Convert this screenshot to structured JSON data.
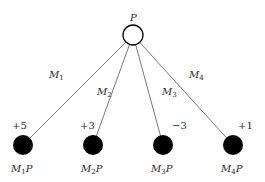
{
  "diagram": {
    "root": {
      "label": "P",
      "x": 133,
      "y": 35,
      "r": 10,
      "fill": "#ffffff",
      "stroke": "#000000"
    },
    "edges": [
      {
        "label_main": "M",
        "label_sub": "1",
        "lx": 49,
        "ly": 78
      },
      {
        "label_main": "M",
        "label_sub": "2",
        "lx": 97,
        "ly": 95
      },
      {
        "label_main": "M",
        "label_sub": "3",
        "lx": 162,
        "ly": 95
      },
      {
        "label_main": "M",
        "label_sub": "4",
        "lx": 189,
        "ly": 78
      }
    ],
    "leaves": [
      {
        "x": 23,
        "y": 145,
        "r": 10,
        "value": "+5",
        "vx": 12,
        "vy": 129,
        "name_main": "M",
        "name_sub": "1",
        "name_tail": "P",
        "nx": 11,
        "ny": 172
      },
      {
        "x": 93,
        "y": 145,
        "r": 10,
        "value": "+3",
        "vx": 80,
        "vy": 129,
        "name_main": "M",
        "name_sub": "2",
        "name_tail": "P",
        "nx": 81,
        "ny": 172
      },
      {
        "x": 163,
        "y": 145,
        "r": 10,
        "value": "−3",
        "vx": 172,
        "vy": 129,
        "name_main": "M",
        "name_sub": "3",
        "name_tail": "P",
        "nx": 151,
        "ny": 172
      },
      {
        "x": 233,
        "y": 145,
        "r": 10,
        "value": "+1",
        "vx": 238,
        "vy": 129,
        "name_main": "M",
        "name_sub": "4",
        "name_tail": "P",
        "nx": 221,
        "ny": 172
      }
    ],
    "colors": {
      "line": "#555555",
      "leaf_fill": "#000000",
      "text": "#2a2a2a"
    }
  }
}
